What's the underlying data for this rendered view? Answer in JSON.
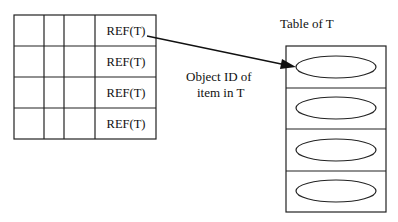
{
  "left_table": {
    "rows": [
      {
        "ref": "REF(T)"
      },
      {
        "ref": "REF(T)"
      },
      {
        "ref": "REF(T)"
      },
      {
        "ref": "REF(T)"
      }
    ]
  },
  "right_table": {
    "title": "Table of T",
    "row_count": 4
  },
  "arrow_label": {
    "line1": "Object ID of",
    "line2": "item in T"
  }
}
